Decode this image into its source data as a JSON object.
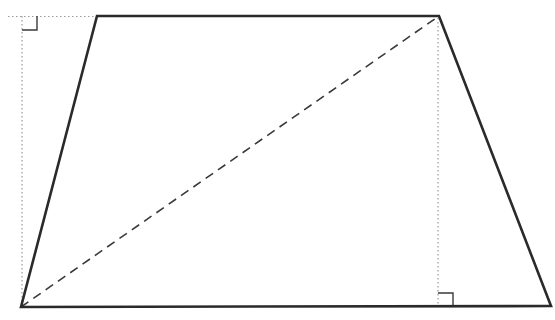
{
  "figure": {
    "type": "trapezoid-with-heights-and-diagonal",
    "stroke_color": "#2a2a2a",
    "dotted_color": "#9a9a9a",
    "vertices": {
      "bottom_left": [
        21,
        307
      ],
      "bottom_right": [
        551,
        306
      ],
      "top_right": [
        439,
        16
      ],
      "top_left": [
        97,
        16
      ]
    },
    "diagonal": {
      "from": "bottom_left",
      "to": "top_right",
      "style": "dashed"
    },
    "heights": [
      {
        "x": 22,
        "y_top": 16,
        "y_bottom": 307,
        "style": "dotted",
        "extension_from_x": 8
      },
      {
        "x": 438,
        "y_top": 16,
        "y_bottom": 306,
        "style": "dotted"
      }
    ],
    "right_angle_marks": [
      {
        "corner": [
          22,
          16
        ],
        "size": 15,
        "orientation": "down-right"
      },
      {
        "corner": [
          438,
          306
        ],
        "size": 14,
        "orientation": "up-right"
      }
    ]
  }
}
